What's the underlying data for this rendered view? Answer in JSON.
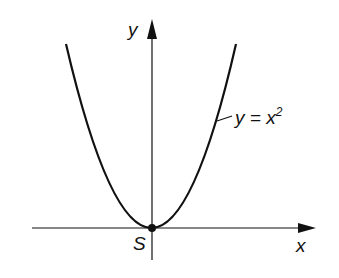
{
  "axes": {
    "x_label": "x",
    "y_label": "y"
  },
  "curve": {
    "equation_lhs": "y = x",
    "equation_exp": "2"
  },
  "vertex": {
    "label": "S"
  },
  "colors": {
    "stroke": "#111111",
    "background": "#ffffff"
  }
}
